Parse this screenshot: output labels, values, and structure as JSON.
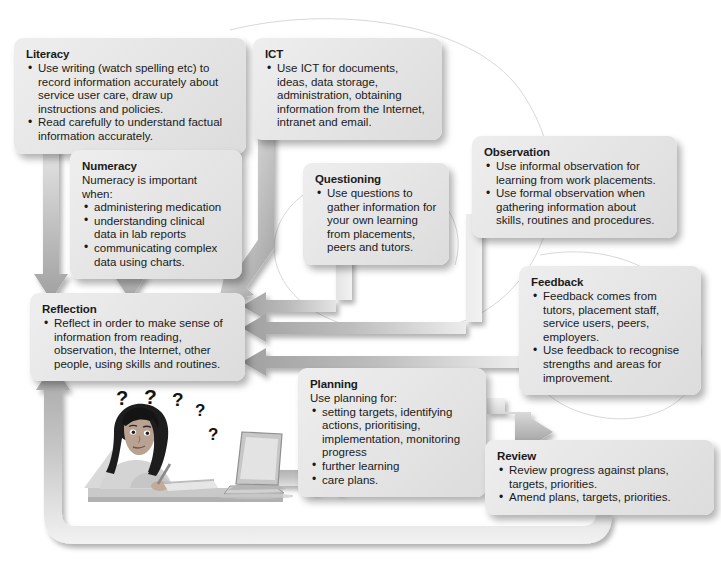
{
  "diagram": {
    "accent_color": "#a9a9a9",
    "box_fill": "#e6e6e6",
    "text_color": "#1a1a1a"
  },
  "boxes": {
    "literacy": {
      "title": "Literacy",
      "items": [
        "Use writing (watch spelling etc) to record information accurately about service user care, draw up instructions and policies.",
        "Read carefully to understand factual information accurately."
      ]
    },
    "ict": {
      "title": "ICT",
      "items": [
        "Use ICT for documents, ideas, data storage, administration, obtaining information from the Internet, intranet and email."
      ]
    },
    "numeracy": {
      "title": "Numeracy",
      "lead": "Numeracy is important when:",
      "items": [
        "administering medication",
        "understanding clinical data in lab reports",
        "communicating complex data using charts."
      ]
    },
    "questioning": {
      "title": "Questioning",
      "items": [
        "Use questions to gather information for your own learning from placements, peers and tutors."
      ]
    },
    "observation": {
      "title": "Observation",
      "items": [
        "Use informal observation for learning from work placements.",
        "Use formal observation when gathering information about skills, routines and procedures."
      ]
    },
    "feedback": {
      "title": "Feedback",
      "items": [
        "Feedback comes from tutors, placement staff, service users, peers, employers.",
        "Use feedback to recognise strengths and areas for improvement."
      ]
    },
    "reflection": {
      "title": "Reflection",
      "items": [
        "Reflect in order to make sense of information from reading, observation, the Internet, other people, using skills and routines."
      ]
    },
    "planning": {
      "title": "Planning",
      "lead": "Use planning for:",
      "items": [
        "setting targets, identifying actions, prioritising, implementation, monitoring progress",
        "further learning",
        "care plans."
      ]
    },
    "review": {
      "title": "Review",
      "items": [
        "Review progress against plans, targets, priorities.",
        "Amend plans, targets, priorities."
      ]
    }
  },
  "illustration": {
    "name": "student-at-laptop-illustration",
    "question_marks": [
      "?",
      "?",
      "?",
      "?",
      "?"
    ]
  },
  "flow": {
    "edges": [
      {
        "from": "literacy",
        "to": "reflection"
      },
      {
        "from": "numeracy",
        "to": "reflection"
      },
      {
        "from": "ict",
        "to": "reflection"
      },
      {
        "from": "questioning",
        "to": "reflection"
      },
      {
        "from": "observation",
        "to": "reflection"
      },
      {
        "from": "feedback",
        "to": "reflection"
      },
      {
        "from": "reflection",
        "to": "planning"
      },
      {
        "from": "planning",
        "to": "review"
      },
      {
        "from": "review",
        "to": "reflection"
      }
    ]
  }
}
